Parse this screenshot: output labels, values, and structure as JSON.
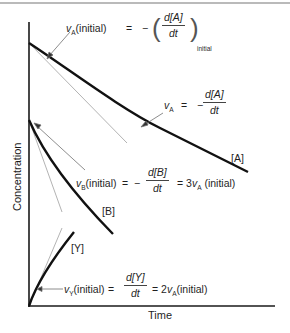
{
  "figure": {
    "axes": {
      "x_label": "Time",
      "y_label": "Concentration"
    },
    "curves": [
      {
        "id": "A",
        "label": "[A]",
        "trend": "decreasing"
      },
      {
        "id": "B",
        "label": "[B]",
        "trend": "decreasing (3x initial rate of A)"
      },
      {
        "id": "Y",
        "label": "[Y]",
        "trend": "increasing (2x initial rate of A)"
      }
    ],
    "annotations": {
      "vA_initial": {
        "lhs_var": "v",
        "lhs_sub": "A",
        "lhs_suffix": "(initial)",
        "eq": "=",
        "sign": "−",
        "num": "d[A]",
        "den": "dt",
        "paren_open": "(",
        "paren_close": ")",
        "post_sub": "initial"
      },
      "vA": {
        "lhs_var": "v",
        "lhs_sub": "A",
        "eq": "=",
        "sign": "−",
        "num": "d[A]",
        "den": "dt"
      },
      "vB_initial": {
        "lhs_var": "v",
        "lhs_sub": "B",
        "lhs_suffix": "(initial)",
        "eq": "=",
        "sign": "−",
        "num": "d[B]",
        "den": "dt",
        "eq2": "= 3",
        "rhs_var": "v",
        "rhs_sub": "A",
        "rhs_suffix": "(initial)"
      },
      "vY_initial": {
        "lhs_var": "v",
        "lhs_sub": "Y",
        "lhs_suffix": "(initial)",
        "eq": "=",
        "num": "d[Y]",
        "den": "dt",
        "eq2": "= 2",
        "rhs_var": "v",
        "rhs_sub": "A",
        "rhs_suffix": "(initial)"
      }
    },
    "colors": {
      "curve": "#111111",
      "tangent": "#9a9a9a",
      "pointer": "#7a7a7a",
      "axis": "#1a1a1a"
    }
  }
}
